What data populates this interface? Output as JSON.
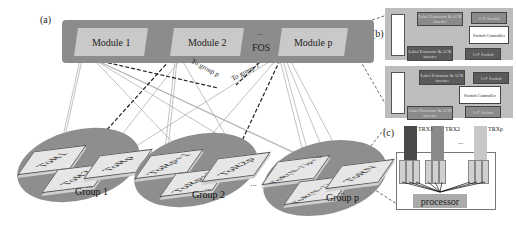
{
  "panel_labels": {
    "a": "(a)",
    "b": "(b)",
    "c": "(c)"
  },
  "fos": {
    "label": "FOS",
    "ellipsis": "...",
    "modules": [
      "Module 1",
      "Module 2",
      "Module p"
    ],
    "color": "#8c8c8c",
    "module_color": "#c9c9c9"
  },
  "arrows": {
    "to_group_p": "To group p",
    "to_group_1": "To group 1"
  },
  "groups": [
    {
      "label": "Group 1",
      "tors": [
        "ToR1",
        "ToR2",
        "ToRp"
      ]
    },
    {
      "label": "Group 2",
      "tors": [
        "ToRp+1",
        "ToRp+2",
        "ToR2p"
      ]
    },
    {
      "label": "Group p",
      "tors": [
        "ToR(N-1)p+1",
        "ToR(N-1)p+2",
        "ToRN"
      ]
    }
  ],
  "group_ellipsis": "...",
  "panel_b": {
    "demux_label": "AWG",
    "blocks": {
      "label_extractor": "Label Extractor & ACK inserter",
      "switch_1x": "1×F Switch",
      "switch_controller": "Switch Controller"
    },
    "wavelengths": [
      "λ1",
      "λi",
      "λp"
    ]
  },
  "panel_c": {
    "transceivers": [
      "TRX1",
      "TRX2",
      "TRXp"
    ],
    "ellipsis": "...",
    "buffer_label": "LB",
    "processor": "processor"
  }
}
